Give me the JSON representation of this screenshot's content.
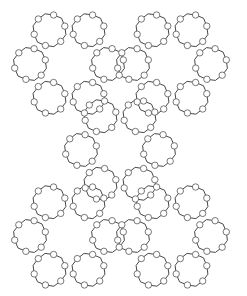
{
  "diagram": {
    "type": "framework-projection",
    "width": 247,
    "height": 296,
    "colors": {
      "background": "#ffffff",
      "bond": "#333333",
      "atom_fill": "#ffffff",
      "atom_stroke": "#555555"
    },
    "large_ring_centers": [
      [
        69,
        64
      ],
      [
        172,
        64
      ],
      [
        120,
        150
      ],
      [
        69,
        236
      ],
      [
        172,
        236
      ]
    ],
    "small_ring_offset": 39,
    "small_ring_radius": 17,
    "atoms_per_small_ring": 6,
    "atom_radius": 3.2
  }
}
